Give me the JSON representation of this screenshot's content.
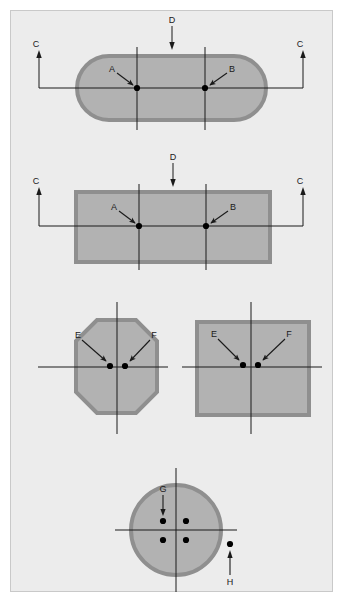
{
  "figure": {
    "background_color": "#ececec",
    "page_color": "#ffffff",
    "frame_border_color": "#c9c9c9",
    "shape_fill_color": "#b2b2b2",
    "shape_border_color": "#8f8f8f",
    "line_color": "#1a1a1a",
    "point_color": "#000000"
  },
  "views": [
    {
      "id": "view-stadium",
      "shape": "stadium",
      "section_labels": [
        "C",
        "C",
        "D"
      ],
      "point_labels": [
        "A",
        "B"
      ]
    },
    {
      "id": "view-rectangle",
      "shape": "rectangle",
      "section_labels": [
        "C",
        "C",
        "D"
      ],
      "point_labels": [
        "A",
        "B"
      ]
    },
    {
      "id": "view-octagon",
      "shape": "octagon",
      "point_labels": [
        "E",
        "F"
      ]
    },
    {
      "id": "view-square",
      "shape": "square",
      "point_labels": [
        "E",
        "F"
      ]
    },
    {
      "id": "view-circle",
      "shape": "circle",
      "point_labels": [
        "G",
        "H"
      ]
    }
  ],
  "labels": {
    "a_top": "A",
    "b_top": "B",
    "c_top_left": "C",
    "c_top_right": "C",
    "d_top": "D",
    "a_mid": "A",
    "b_mid": "B",
    "c_mid_left": "C",
    "c_mid_right": "C",
    "d_mid": "D",
    "e_oct": "E",
    "f_oct": "F",
    "e_sq": "E",
    "f_sq": "F",
    "g_circle": "G",
    "h_circle": "H"
  }
}
